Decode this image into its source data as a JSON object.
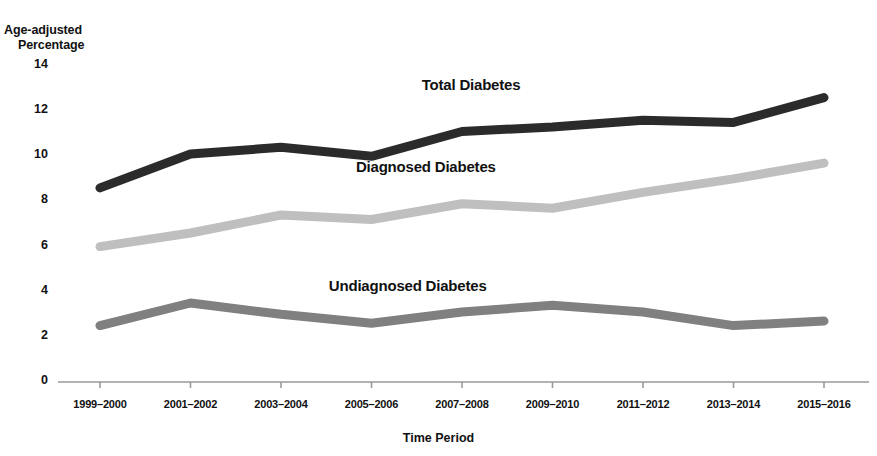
{
  "chart_data": {
    "type": "line",
    "title": "",
    "xlabel": "Time Period",
    "ylabel": "Age-adjusted\nPercentage",
    "ylabel_line1": "Age-adjusted",
    "ylabel_line2": "Percentage",
    "categories": [
      "1999–2000",
      "2001–2002",
      "2003–2004",
      "2005–2006",
      "2007–2008",
      "2009–2010",
      "2011–2012",
      "2013–2014",
      "2015–2016"
    ],
    "ylim": [
      0,
      14
    ],
    "yticks": [
      0,
      2,
      4,
      6,
      8,
      10,
      12,
      14
    ],
    "ytick_labels": [
      "0",
      "2",
      "4",
      "6",
      "8",
      "10",
      "12",
      "14"
    ],
    "grid": false,
    "legend_position": "inline-above-series",
    "series": [
      {
        "name": "Total Diabetes",
        "color": "#2b2b2b",
        "values": [
          8.6,
          10.1,
          10.4,
          10.0,
          11.1,
          11.3,
          11.6,
          11.5,
          12.6
        ],
        "label_anchor_index": 4.1,
        "label_value": 13.1
      },
      {
        "name": "Diagnosed Diabetes",
        "color": "#bfbfbf",
        "values": [
          6.0,
          6.6,
          7.4,
          7.2,
          7.9,
          7.7,
          8.4,
          9.0,
          9.7
        ],
        "label_anchor_index": 3.6,
        "label_value": 9.5
      },
      {
        "name": "Undiagnosed Diabetes",
        "color": "#808080",
        "values": [
          2.5,
          3.5,
          3.0,
          2.6,
          3.1,
          3.4,
          3.1,
          2.5,
          2.7
        ],
        "label_anchor_index": 3.4,
        "label_value": 4.2
      }
    ],
    "axis_color": "#9a9a9a",
    "line_width": 9
  }
}
